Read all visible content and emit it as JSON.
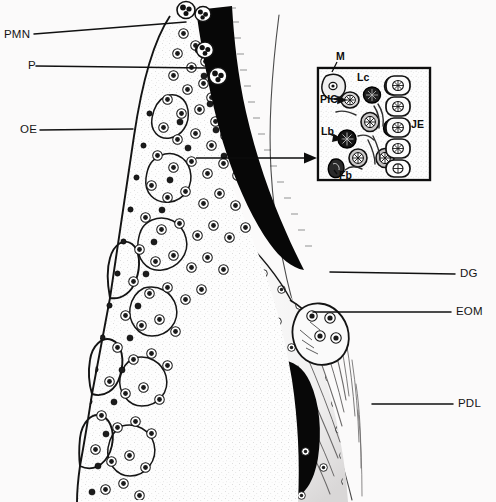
{
  "figure": {
    "background_color": "#fbfafa",
    "ink_color": "#111111",
    "width": 496,
    "height": 502
  },
  "labels": {
    "pmn": {
      "text": "PMN",
      "x": 4,
      "y": 29,
      "leader_to_x": 186,
      "leader_to_y": 22
    },
    "p": {
      "text": "P",
      "x": 28,
      "y": 60,
      "leader_to_x": 205,
      "leader_to_y": 67
    },
    "oe": {
      "text": "OE",
      "x": 20,
      "y": 124,
      "leader_to_x": 133,
      "leader_to_y": 129
    },
    "dg": {
      "text": "DG",
      "x": 460,
      "y": 269,
      "leader_to_x": 330,
      "leader_to_y": 272
    },
    "eom": {
      "text": "EOM",
      "x": 456,
      "y": 307,
      "leader_to_x": 313,
      "leader_to_y": 312
    },
    "pdl": {
      "text": "PDL",
      "x": 458,
      "y": 398,
      "leader_to_x": 372,
      "leader_to_y": 404
    }
  },
  "inset": {
    "box": {
      "x": 318,
      "y": 68,
      "width": 112,
      "height": 112
    },
    "arrow": {
      "from_x": 196,
      "from_y": 158,
      "to_x": 316,
      "to_y": 158
    },
    "labels": {
      "m": {
        "text": "M",
        "x": 336,
        "y": 57
      },
      "lc": {
        "text": "Lc",
        "x": 358,
        "y": 77
      },
      "pic": {
        "text": "PIC",
        "x": 320,
        "y": 98
      },
      "lb": {
        "text": "Lb",
        "x": 322,
        "y": 130
      },
      "je": {
        "text": "JE",
        "x": 410,
        "y": 123
      },
      "fb": {
        "text": "Fb",
        "x": 333,
        "y": 172
      }
    }
  },
  "legend_meaning": {
    "PMN": "polymorphonuclear leukocyte",
    "P": "pocket",
    "OE": "oral epithelium",
    "DG": "dentogingival fibers",
    "EOM": "external oral margin",
    "PDL": "periodontal ligament",
    "M": "macrophage",
    "Lc": "lymphocyte",
    "PIC": "plasma-infiltrating cell",
    "Lb": "lymphoblast",
    "JE": "junctional epithelium",
    "Fb": "fibroblast"
  }
}
